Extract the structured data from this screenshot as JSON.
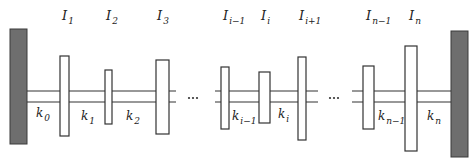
{
  "diagram": {
    "colors": {
      "wall": "#6e6e6e",
      "wall_edge": "#3a3a3a",
      "line": "#333333",
      "disc_fill": "#ffffff"
    },
    "walls": [
      {
        "id": "left-wall",
        "x": 10,
        "y": 29,
        "w": 17,
        "h": 115
      },
      {
        "id": "right-wall",
        "x": 451,
        "y": 31,
        "w": 17,
        "h": 126
      }
    ],
    "shaft": {
      "y_top": 91,
      "y_bottom": 102,
      "segments": [
        {
          "x1": 27,
          "x2": 176
        },
        {
          "x1": 215,
          "x2": 318
        },
        {
          "x1": 352,
          "x2": 451
        }
      ]
    },
    "ellipsis": [
      {
        "x": 193,
        "y": 98,
        "text": "..."
      },
      {
        "x": 334,
        "y": 98,
        "text": "..."
      }
    ],
    "discs": [
      {
        "label": "I",
        "sub": "1",
        "x": 60,
        "y": 56,
        "w": 9,
        "h": 80,
        "lx": 62,
        "ly": 20
      },
      {
        "label": "I",
        "sub": "2",
        "x": 105,
        "y": 70,
        "w": 7,
        "h": 54,
        "lx": 106,
        "ly": 20
      },
      {
        "label": "I",
        "sub": "3",
        "x": 156,
        "y": 60,
        "w": 13,
        "h": 74,
        "lx": 157,
        "ly": 20
      },
      {
        "label": "I",
        "sub": "i−1",
        "x": 221,
        "y": 67,
        "w": 8,
        "h": 62,
        "lx": 223,
        "ly": 20
      },
      {
        "label": "I",
        "sub": "i",
        "x": 259,
        "y": 72,
        "w": 11,
        "h": 51,
        "lx": 261,
        "ly": 20
      },
      {
        "label": "I",
        "sub": "i+1",
        "x": 298,
        "y": 57,
        "w": 8,
        "h": 83,
        "lx": 299,
        "ly": 20
      },
      {
        "label": "I",
        "sub": "n−1",
        "x": 363,
        "y": 66,
        "w": 11,
        "h": 63,
        "lx": 366,
        "ly": 20
      },
      {
        "label": "I",
        "sub": "n",
        "x": 405,
        "y": 46,
        "w": 12,
        "h": 105,
        "lx": 409,
        "ly": 20
      }
    ],
    "springs": [
      {
        "label": "k",
        "sub": "0",
        "x": 36,
        "y": 117
      },
      {
        "label": "k",
        "sub": "1",
        "x": 81,
        "y": 120
      },
      {
        "label": "k",
        "sub": "2",
        "x": 126,
        "y": 120
      },
      {
        "label": "k",
        "sub": "i−1",
        "x": 232,
        "y": 120
      },
      {
        "label": "k",
        "sub": "i",
        "x": 278,
        "y": 118
      },
      {
        "label": "k",
        "sub": "n−1",
        "x": 378,
        "y": 120
      },
      {
        "label": "k",
        "sub": "n",
        "x": 427,
        "y": 120
      }
    ]
  }
}
